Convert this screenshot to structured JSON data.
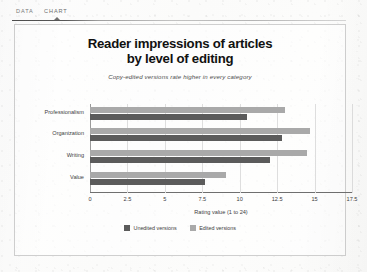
{
  "tabs": [
    {
      "label": "DATA",
      "active": false
    },
    {
      "label": "CHART",
      "active": true
    }
  ],
  "chart_data": {
    "type": "bar",
    "orientation": "horizontal",
    "title_line1": "Reader impressions of articles",
    "title_line2": "by level of editing",
    "subtitle": "Copy-edited versions rate higher in every category",
    "xlabel": "Rating value (1 to 24)",
    "ylabel": "",
    "categories": [
      "Professionalism",
      "Organization",
      "Writing",
      "Value"
    ],
    "series": [
      {
        "name": "Unedited versions",
        "color": "#5b5b5b",
        "values": [
          10.5,
          12.8,
          12.0,
          7.7
        ]
      },
      {
        "name": "Edited versions",
        "color": "#a9a9a9",
        "values": [
          13.0,
          14.7,
          14.5,
          9.1
        ]
      }
    ],
    "xticks": [
      "0",
      "2.5",
      "5",
      "7.5",
      "10",
      "12.5",
      "15",
      "17.5"
    ],
    "xlim": [
      0,
      17.5
    ],
    "grid": true,
    "legend_position": "bottom"
  }
}
